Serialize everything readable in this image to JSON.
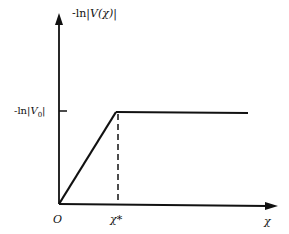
{
  "diagram": {
    "type": "piecewise-linear plot",
    "y_axis_label_prefix": "-ln|",
    "y_axis_label_var": "V(χ)",
    "y_axis_label_suffix": "|",
    "y_tick_label_prefix": "-ln|",
    "y_tick_label_var": "V",
    "y_tick_label_sub": "0",
    "y_tick_label_suffix": "|",
    "origin_label": "O",
    "x_tick_label": "χ*",
    "x_axis_label": "χ",
    "segments": [
      {
        "description": "linear rise from origin to knee",
        "from": "O",
        "to": "(χ*, -ln|V0|)"
      },
      {
        "description": "flat plateau",
        "from": "(χ*, -ln|V0|)",
        "to": "right edge",
        "value": "-ln|V0|"
      }
    ],
    "dashed_guide": "vertical dashed line at χ* from knee to x-axis",
    "colors": {
      "line": "#111111",
      "background": "#ffffff"
    }
  }
}
